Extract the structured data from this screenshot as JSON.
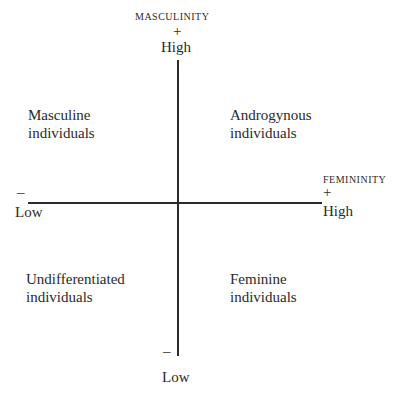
{
  "diagram": {
    "type": "quadrant",
    "vertical_axis": {
      "name": "MASCULINITY",
      "high_sign": "+",
      "high_label": "High",
      "low_sign": "–",
      "low_label": "Low"
    },
    "horizontal_axis": {
      "name": "FEMININITY",
      "high_sign": "+",
      "high_label": "High",
      "low_sign": "–",
      "low_label": "Low"
    },
    "quadrants": {
      "top_left": [
        "Masculine",
        "individuals"
      ],
      "top_right": [
        "Androgynous",
        "individuals"
      ],
      "bottom_left": [
        "Undifferentiated",
        "individuals"
      ],
      "bottom_right": [
        "Feminine",
        "individuals"
      ]
    }
  }
}
